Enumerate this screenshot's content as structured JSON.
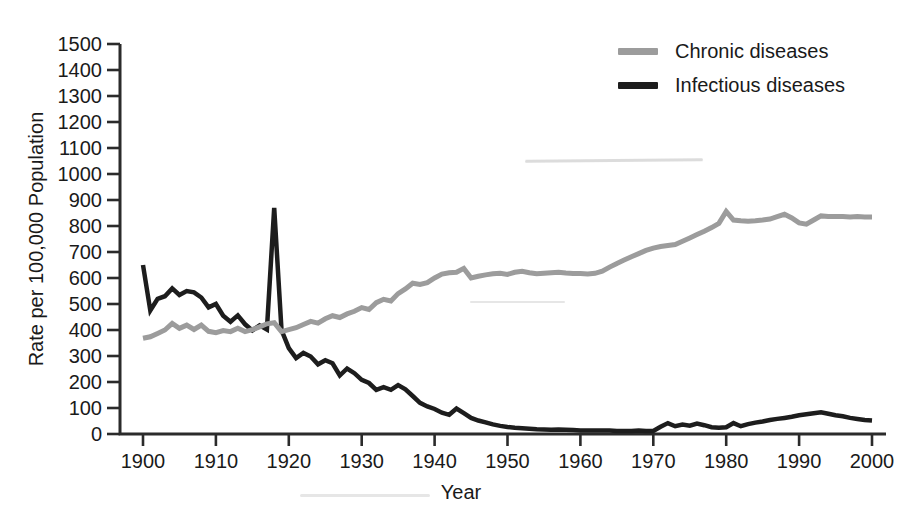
{
  "figure": {
    "background_color": "#ffffff",
    "text_color": "#1a1a1a",
    "axis_color": "#2b2b2b"
  },
  "chart_data": {
    "type": "line",
    "title": "",
    "xlabel": "Year",
    "ylabel": "Rate per 100,000 Population",
    "xlim": [
      1900,
      2000
    ],
    "ylim": [
      0,
      1500
    ],
    "ytick_step": 100,
    "xticks": [
      1900,
      1910,
      1920,
      1930,
      1940,
      1950,
      1960,
      1970,
      1980,
      1990,
      2000
    ],
    "grid": false,
    "legend_position": "top-right",
    "x": [
      1900,
      1901,
      1902,
      1903,
      1904,
      1905,
      1906,
      1907,
      1908,
      1909,
      1910,
      1911,
      1912,
      1913,
      1914,
      1915,
      1916,
      1917,
      1918,
      1919,
      1920,
      1921,
      1922,
      1923,
      1924,
      1925,
      1926,
      1927,
      1928,
      1929,
      1930,
      1931,
      1932,
      1933,
      1934,
      1935,
      1936,
      1937,
      1938,
      1939,
      1940,
      1941,
      1942,
      1943,
      1944,
      1945,
      1946,
      1947,
      1948,
      1949,
      1950,
      1951,
      1952,
      1953,
      1954,
      1955,
      1956,
      1957,
      1958,
      1959,
      1960,
      1961,
      1962,
      1963,
      1964,
      1965,
      1966,
      1967,
      1968,
      1969,
      1970,
      1971,
      1972,
      1973,
      1974,
      1975,
      1976,
      1977,
      1978,
      1979,
      1980,
      1981,
      1982,
      1983,
      1984,
      1985,
      1986,
      1987,
      1988,
      1989,
      1990,
      1991,
      1992,
      1993,
      1994,
      1995,
      1996,
      1997,
      1998,
      1999,
      2000
    ],
    "series": [
      {
        "name": "Chronic diseases",
        "color": "#9c9c9c",
        "values": [
          368,
          374,
          387,
          400,
          425,
          406,
          419,
          402,
          419,
          395,
          390,
          398,
          394,
          407,
          394,
          401,
          412,
          424,
          428,
          394,
          401,
          409,
          421,
          433,
          426,
          443,
          455,
          448,
          462,
          472,
          486,
          479,
          505,
          518,
          512,
          540,
          558,
          580,
          575,
          582,
          600,
          615,
          620,
          622,
          637,
          600,
          607,
          612,
          616,
          618,
          614,
          622,
          626,
          620,
          616,
          618,
          620,
          622,
          619,
          617,
          617,
          615,
          618,
          626,
          642,
          656,
          669,
          682,
          694,
          706,
          715,
          721,
          725,
          729,
          741,
          754,
          767,
          780,
          794,
          810,
          856,
          823,
          820,
          818,
          820,
          823,
          827,
          836,
          845,
          831,
          812,
          807,
          823,
          839,
          837,
          836,
          836,
          835,
          836,
          835,
          835
        ]
      },
      {
        "name": "Infectious diseases",
        "color": "#1d1d1d",
        "values": [
          650,
          475,
          520,
          530,
          560,
          535,
          550,
          545,
          525,
          487,
          500,
          455,
          432,
          456,
          422,
          398,
          418,
          402,
          870,
          400,
          330,
          292,
          312,
          298,
          268,
          284,
          272,
          225,
          252,
          234,
          208,
          196,
          170,
          180,
          170,
          188,
          172,
          146,
          120,
          106,
          96,
          82,
          74,
          98,
          80,
          62,
          52,
          45,
          37,
          31,
          27,
          24,
          22,
          20,
          18,
          17,
          16,
          17,
          16,
          15,
          14,
          14,
          13,
          14,
          13,
          12,
          12,
          12,
          13,
          12,
          12,
          28,
          42,
          30,
          36,
          32,
          40,
          34,
          26,
          24,
          26,
          42,
          30,
          38,
          44,
          48,
          54,
          58,
          62,
          66,
          72,
          76,
          80,
          84,
          78,
          72,
          68,
          62,
          58,
          54,
          52
        ]
      }
    ]
  }
}
